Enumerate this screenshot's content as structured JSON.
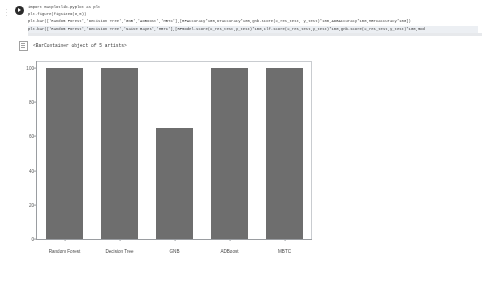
{
  "notebook": {
    "cell": {
      "run_icon": "run-cell-icon",
      "code_lines": [
        "import matplotlib.pyplot as plt",
        "plt.figure(figsize=(8,5))",
        "plt.bar(['Random Forest','Decision Tree','GNB','ADBoost','MBTC'],[RFAccuracy*100,DTaccuracy*100,gnb.score(X_res_test, y_test)*100,ADBAccuracy*100,MBTCaccuracy*100])",
        "plt.bar(['Random Forest','Decision Tree','Naive Bayes','MBTC'],[RFmodel.score(X_res_test,y_test)*100,clf.score(X_res_test,y_test)*100,gnb.score(X_res_test,y_test)*100,mod"
      ],
      "selected_line_index": 3
    },
    "output": {
      "icon": "output-icon",
      "text": "<BarContainer object of 5 artists>"
    }
  },
  "chart_data": {
    "type": "bar",
    "title": "",
    "xlabel": "",
    "ylabel": "",
    "categories": [
      "Random Forest",
      "Decision Tree",
      "GNB",
      "ADBoost",
      "MBTC"
    ],
    "values": [
      100,
      100,
      65,
      100,
      100
    ],
    "ylim": [
      0,
      104
    ],
    "yticks": [
      0,
      20,
      40,
      60,
      80,
      100
    ],
    "ytick_labels": [
      "0",
      "20",
      "40",
      "60",
      "80",
      "100"
    ],
    "grid": false,
    "legend": null,
    "bar_color": "#6e6e6e"
  }
}
